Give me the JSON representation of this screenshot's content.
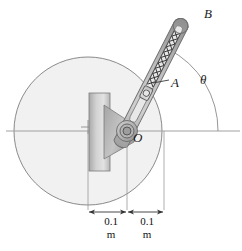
{
  "figure": {
    "labels": {
      "point_b": "B",
      "point_a": "A",
      "pivot_o": "O",
      "angle_theta": "θ"
    },
    "dimensions": [
      {
        "value": "0.1",
        "unit": "m"
      },
      {
        "value": "0.1",
        "unit": "m"
      }
    ],
    "colors": {
      "outline": "#6b6b6b",
      "disk_fill": "#f0f0f0",
      "arm_fill": "#b9b9b9",
      "bar_fill": "#c9c9c9",
      "spring": "#3a3a3a",
      "axis": "#9a9a9a",
      "text": "#1a1a1a"
    },
    "geometry": {
      "disk_center_x": 88,
      "disk_center_y": 131,
      "disk_radius": 74,
      "pivot_x": 127,
      "pivot_y": 131,
      "arm_angle_deg": 63,
      "arm_tip_x": 186,
      "arm_tip_y": 14
    }
  }
}
